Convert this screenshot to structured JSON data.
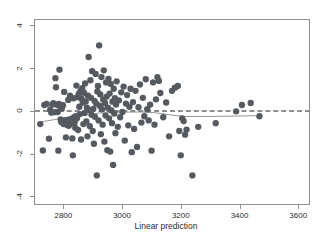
{
  "figure": {
    "background_color": "#ffffff",
    "width": 332,
    "height": 240
  },
  "axes": {
    "x_title": "Linear prediction",
    "y_title": "",
    "x_ticks": [
      "2800",
      "3000",
      "3200",
      "3400",
      "3600"
    ],
    "y_ticks": [
      "4",
      "2",
      "0",
      "-2",
      "-4"
    ],
    "frame_color": "#8f8f8f",
    "tick_label_color": "#2b2b2b"
  },
  "chart_data": {
    "type": "scatter",
    "title": "",
    "xlabel": "Linear prediction",
    "ylabel": "",
    "xlim": [
      2700,
      3640
    ],
    "ylim": [
      -4.4,
      4.3
    ],
    "grid": false,
    "legend": "none",
    "marker_color": "#555a60",
    "marker_size": 3.2,
    "xticks": [
      2800,
      3000,
      3200,
      3400,
      3600
    ],
    "yticks": [
      4,
      2,
      0,
      -2,
      -4
    ],
    "points": [
      [
        2718,
        -0.62
      ],
      [
        2727,
        -1.87
      ],
      [
        2732,
        0.28
      ],
      [
        2740,
        0.33
      ],
      [
        2748,
        -1.31
      ],
      [
        2752,
        0.05
      ],
      [
        2756,
        -0.08
      ],
      [
        2760,
        0.3
      ],
      [
        2763,
        0.37
      ],
      [
        2767,
        -0.06
      ],
      [
        2770,
        1.55
      ],
      [
        2772,
        1.12
      ],
      [
        2775,
        0.29
      ],
      [
        2778,
        -0.05
      ],
      [
        2780,
        -1.88
      ],
      [
        2782,
        0.33
      ],
      [
        2784,
        1.95
      ],
      [
        2786,
        0.22
      ],
      [
        2788,
        -0.4
      ],
      [
        2790,
        -0.52
      ],
      [
        2792,
        0.12
      ],
      [
        2794,
        -0.55
      ],
      [
        2796,
        0.27
      ],
      [
        2798,
        -0.62
      ],
      [
        2800,
        0.9
      ],
      [
        2802,
        -0.58
      ],
      [
        2804,
        -0.45
      ],
      [
        2806,
        -1.25
      ],
      [
        2808,
        -0.48
      ],
      [
        2810,
        -0.67
      ],
      [
        2812,
        -0.42
      ],
      [
        2814,
        0.52
      ],
      [
        2816,
        -0.7
      ],
      [
        2818,
        -0.52
      ],
      [
        2820,
        0.72
      ],
      [
        2822,
        -0.6
      ],
      [
        2824,
        -0.38
      ],
      [
        2826,
        -0.47
      ],
      [
        2828,
        -1.3
      ],
      [
        2830,
        -2.1
      ],
      [
        2832,
        0.6
      ],
      [
        2834,
        -0.3
      ],
      [
        2836,
        -0.55
      ],
      [
        2838,
        -0.8
      ],
      [
        2840,
        -0.25
      ],
      [
        2842,
        1.2
      ],
      [
        2844,
        -0.35
      ],
      [
        2846,
        0.65
      ],
      [
        2848,
        -0.9
      ],
      [
        2850,
        0.8
      ],
      [
        2852,
        0.2
      ],
      [
        2854,
        -0.15
      ],
      [
        2856,
        0.95
      ],
      [
        2858,
        -1.35
      ],
      [
        2860,
        0.58
      ],
      [
        2862,
        1.08
      ],
      [
        2864,
        0.4
      ],
      [
        2866,
        -0.62
      ],
      [
        2868,
        0.86
      ],
      [
        2870,
        -0.1
      ],
      [
        2872,
        1.3
      ],
      [
        2874,
        0.45
      ],
      [
        2876,
        -0.5
      ],
      [
        2878,
        0.15
      ],
      [
        2880,
        -1.2
      ],
      [
        2882,
        0.72
      ],
      [
        2884,
        2.55
      ],
      [
        2886,
        0.05
      ],
      [
        2888,
        -0.72
      ],
      [
        2890,
        1.45
      ],
      [
        2892,
        0.62
      ],
      [
        2894,
        -0.18
      ],
      [
        2896,
        1.88
      ],
      [
        2898,
        -0.95
      ],
      [
        2900,
        0.1
      ],
      [
        2902,
        -1.55
      ],
      [
        2904,
        0.48
      ],
      [
        2906,
        -0.28
      ],
      [
        2908,
        1.75
      ],
      [
        2910,
        0.35
      ],
      [
        2912,
        -3.05
      ],
      [
        2914,
        0.92
      ],
      [
        2916,
        1.18
      ],
      [
        2918,
        -0.45
      ],
      [
        2920,
        3.1
      ],
      [
        2922,
        0.25
      ],
      [
        2924,
        0.78
      ],
      [
        2926,
        -1.1
      ],
      [
        2928,
        1.6
      ],
      [
        2930,
        0.08
      ],
      [
        2932,
        -0.65
      ],
      [
        2934,
        0.55
      ],
      [
        2936,
        1.92
      ],
      [
        2938,
        -1.45
      ],
      [
        2940,
        0.38
      ],
      [
        2942,
        -0.22
      ],
      [
        2944,
        1.35
      ],
      [
        2946,
        0.68
      ],
      [
        2948,
        -1.85
      ],
      [
        2950,
        0.15
      ],
      [
        2952,
        1.52
      ],
      [
        2954,
        -0.35
      ],
      [
        2956,
        0.82
      ],
      [
        2958,
        -1.92
      ],
      [
        2960,
        1.28
      ],
      [
        2962,
        0.02
      ],
      [
        2964,
        -0.58
      ],
      [
        2966,
        0.44
      ],
      [
        2968,
        -2.55
      ],
      [
        2970,
        1.05
      ],
      [
        2972,
        -0.12
      ],
      [
        2974,
        0.6
      ],
      [
        2976,
        -1.05
      ],
      [
        2978,
        0.3
      ],
      [
        2980,
        1.4
      ],
      [
        2984,
        -0.75
      ],
      [
        2988,
        0.5
      ],
      [
        2992,
        -0.3
      ],
      [
        2996,
        0.88
      ],
      [
        3000,
        -0.05
      ],
      [
        3004,
        1.15
      ],
      [
        3008,
        -1.4
      ],
      [
        3012,
        0.35
      ],
      [
        3016,
        0.75
      ],
      [
        3020,
        -0.68
      ],
      [
        3024,
        0.2
      ],
      [
        3028,
        1.05
      ],
      [
        3032,
        -1.95
      ],
      [
        3036,
        0.42
      ],
      [
        3040,
        -0.85
      ],
      [
        3045,
        0.95
      ],
      [
        3050,
        -1.7
      ],
      [
        3055,
        0.18
      ],
      [
        3060,
        1.25
      ],
      [
        3065,
        -0.55
      ],
      [
        3070,
        0.62
      ],
      [
        3075,
        -0.25
      ],
      [
        3080,
        1.5
      ],
      [
        3085,
        0.08
      ],
      [
        3090,
        -0.45
      ],
      [
        3095,
        0.3
      ],
      [
        3100,
        -1.88
      ],
      [
        3105,
        1.35
      ],
      [
        3110,
        -0.65
      ],
      [
        3115,
        0.55
      ],
      [
        3120,
        1.6
      ],
      [
        3125,
        1.42
      ],
      [
        3130,
        0.85
      ],
      [
        3140,
        -0.3
      ],
      [
        3150,
        0.4
      ],
      [
        3160,
        -1.2
      ],
      [
        3170,
        0.95
      ],
      [
        3180,
        1.1
      ],
      [
        3190,
        1.18
      ],
      [
        3195,
        -0.95
      ],
      [
        3200,
        -2.1
      ],
      [
        3205,
        -0.35
      ],
      [
        3210,
        -0.48
      ],
      [
        3215,
        -1.12
      ],
      [
        3220,
        -0.88
      ],
      [
        3240,
        -3.05
      ],
      [
        3260,
        -0.75
      ],
      [
        3320,
        -0.58
      ],
      [
        3390,
        -0.02
      ],
      [
        3410,
        0.28
      ],
      [
        3440,
        0.38
      ],
      [
        3470,
        -0.25
      ]
    ],
    "reference_line": {
      "type": "dashed-horizontal",
      "y": 0,
      "color": "#1a1a1a",
      "dash": "5,3"
    },
    "smoother_line": {
      "type": "lowess",
      "color": "#8a8a8a",
      "points": [
        [
          2718,
          -0.52
        ],
        [
          2780,
          -0.38
        ],
        [
          2850,
          -0.2
        ],
        [
          2920,
          -0.1
        ],
        [
          2990,
          -0.06
        ],
        [
          3060,
          -0.05
        ],
        [
          3110,
          -0.08
        ],
        [
          3160,
          -0.18
        ],
        [
          3210,
          -0.26
        ],
        [
          3300,
          -0.26
        ],
        [
          3400,
          -0.24
        ],
        [
          3470,
          -0.22
        ]
      ]
    }
  }
}
